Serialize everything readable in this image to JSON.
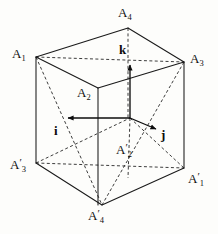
{
  "figure": {
    "background_color": "#fdfdfb",
    "line_color": "#1a1a1a",
    "vertices": [
      {
        "id": "A1",
        "label_base": "A",
        "label_sub": "1",
        "primed": false,
        "x": 36,
        "y": 57,
        "label_x": 12,
        "label_y": 47
      },
      {
        "id": "A4",
        "label_base": "A",
        "label_sub": "4",
        "primed": false,
        "x": 128,
        "y": 28,
        "label_x": 118,
        "label_y": 6
      },
      {
        "id": "A3",
        "label_base": "A",
        "label_sub": "3",
        "primed": false,
        "x": 184,
        "y": 62,
        "label_x": 190,
        "label_y": 52
      },
      {
        "id": "A2",
        "label_base": "A",
        "label_sub": "2",
        "primed": false,
        "x": 98,
        "y": 88,
        "label_x": 77,
        "label_y": 86
      },
      {
        "id": "A3p",
        "label_base": "A",
        "label_sub": "3",
        "primed": true,
        "x": 36,
        "y": 163,
        "label_x": 10,
        "label_y": 158
      },
      {
        "id": "A4p",
        "label_base": "A",
        "label_sub": "4",
        "primed": true,
        "x": 102,
        "y": 205,
        "label_x": 88,
        "label_y": 209
      },
      {
        "id": "A1p",
        "label_base": "A",
        "label_sub": "1",
        "primed": true,
        "x": 184,
        "y": 168,
        "label_x": 188,
        "label_y": 172
      },
      {
        "id": "A2p",
        "label_base": "A",
        "label_sub": "2",
        "primed": true,
        "x": 130,
        "y": 118,
        "label_x": 116,
        "label_y": 143
      }
    ],
    "vectors": [
      {
        "id": "i",
        "label": "i",
        "from_x": 130,
        "from_y": 118,
        "to_x": 68,
        "to_y": 118,
        "label_x": 54,
        "label_y": 124
      },
      {
        "id": "j",
        "label": "j",
        "from_x": 130,
        "from_y": 118,
        "to_x": 156,
        "to_y": 129,
        "label_x": 161,
        "label_y": 128
      },
      {
        "id": "k",
        "label": "k",
        "from_x": 130,
        "from_y": 118,
        "to_x": 130,
        "to_y": 65,
        "label_x": 119,
        "label_y": 43
      }
    ],
    "solid_edges": [
      {
        "name": "edge-A1-A4",
        "x1": 36,
        "y1": 57,
        "x2": 128,
        "y2": 28
      },
      {
        "name": "edge-A4-A3",
        "x1": 128,
        "y1": 28,
        "x2": 184,
        "y2": 62
      },
      {
        "name": "edge-A1-A2",
        "x1": 36,
        "y1": 57,
        "x2": 98,
        "y2": 88
      },
      {
        "name": "edge-A2-A3",
        "x1": 98,
        "y1": 88,
        "x2": 184,
        "y2": 62
      },
      {
        "name": "edge-A1-A3p",
        "x1": 36,
        "y1": 57,
        "x2": 36,
        "y2": 163
      },
      {
        "name": "edge-A3-A1p",
        "x1": 184,
        "y1": 62,
        "x2": 184,
        "y2": 168
      },
      {
        "name": "edge-A2-A2p",
        "x1": 98,
        "y1": 88,
        "x2": 98,
        "y2": 205
      },
      {
        "name": "edge-A3p-A4p",
        "x1": 36,
        "y1": 163,
        "x2": 102,
        "y2": 205
      },
      {
        "name": "edge-A4p-A1p",
        "x1": 102,
        "y1": 205,
        "x2": 184,
        "y2": 168
      }
    ],
    "dashed_edges": [
      {
        "name": "hidden-edge-A1-A3",
        "x1": 36,
        "y1": 57,
        "x2": 184,
        "y2": 62
      },
      {
        "name": "hidden-edge-A4-A4p",
        "x1": 128,
        "y1": 28,
        "x2": 128,
        "y2": 118
      },
      {
        "name": "hidden-edge-A4-A4p-lower",
        "x1": 130,
        "y1": 118,
        "x2": 128,
        "y2": 178
      },
      {
        "name": "hidden-edge-A3p-A2p",
        "x1": 36,
        "y1": 163,
        "x2": 130,
        "y2": 118
      },
      {
        "name": "hidden-edge-A2p-A1p",
        "x1": 130,
        "y1": 118,
        "x2": 184,
        "y2": 168
      },
      {
        "name": "tetra-edge-A1-A4p",
        "x1": 36,
        "y1": 57,
        "x2": 102,
        "y2": 205
      },
      {
        "name": "tetra-edge-A3-A4p",
        "x1": 184,
        "y1": 62,
        "x2": 102,
        "y2": 205
      },
      {
        "name": "tetra-edge-A3p-A1p",
        "x1": 36,
        "y1": 163,
        "x2": 184,
        "y2": 168
      }
    ]
  }
}
